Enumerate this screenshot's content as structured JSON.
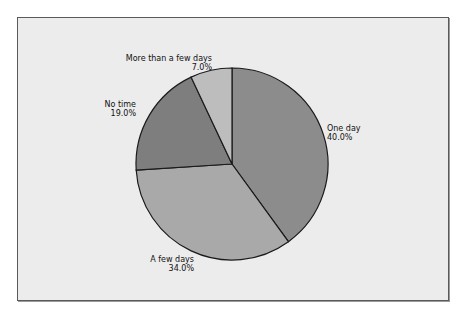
{
  "chart_data": {
    "type": "pie",
    "title": "",
    "categories": [
      "One day",
      "A few days",
      "No time",
      "More than a few days"
    ],
    "values": [
      40.0,
      34.0,
      19.0,
      7.0
    ],
    "value_labels": [
      "40.0%",
      "34.0%",
      "19.0%",
      "7.0%"
    ],
    "colors": [
      "#8c8c8c",
      "#a9a9a9",
      "#7e7e7e",
      "#bdbdbd"
    ],
    "start_angle_deg": 0,
    "direction": "clockwise",
    "legend": "none",
    "labels_position": "outside"
  },
  "labels": {
    "one_day": {
      "name": "One day",
      "pct": "40.0%"
    },
    "few_days": {
      "name": "A few days",
      "pct": "34.0%"
    },
    "no_time": {
      "name": "No time",
      "pct": "19.0%"
    },
    "more_days": {
      "name": "More than a few days",
      "pct": "7.0%"
    }
  }
}
